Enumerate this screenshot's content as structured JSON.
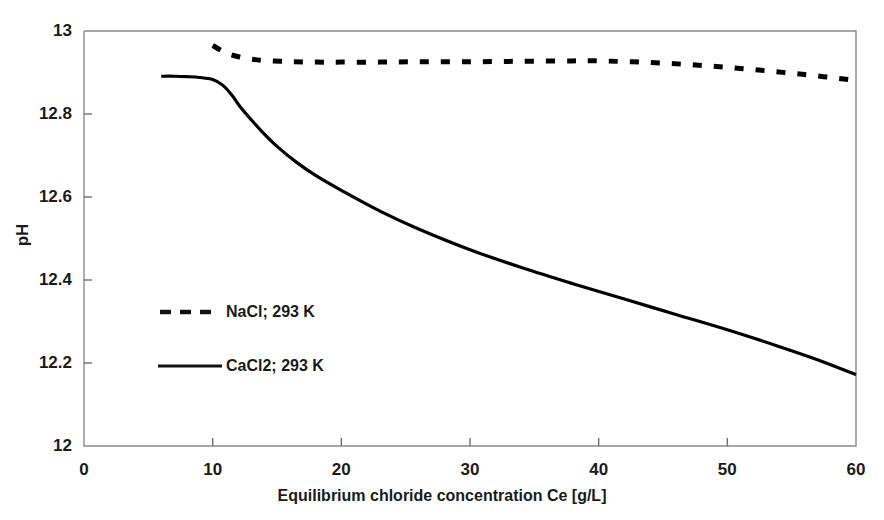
{
  "chart_data": {
    "type": "line",
    "title": "",
    "xlabel": "Equilibrium chloride concentration Ce [g/L]",
    "ylabel": "pH",
    "xlim": [
      0,
      60
    ],
    "ylim": [
      12,
      13
    ],
    "xticks": [
      "0",
      "10",
      "20",
      "30",
      "40",
      "50",
      "60"
    ],
    "xtick_values": [
      0,
      10,
      20,
      30,
      40,
      50,
      60
    ],
    "yticks": [
      "12",
      "12.2",
      "12.4",
      "12.6",
      "12.8",
      "13"
    ],
    "ytick_values": [
      12,
      12.2,
      12.4,
      12.6,
      12.8,
      13
    ],
    "grid": false,
    "legend_position": "inside-left",
    "series": [
      {
        "name": "NaCl; 293 K",
        "style": "dashed",
        "color": "#000000",
        "x": [
          10,
          11,
          12,
          13,
          14,
          16,
          18,
          20,
          23,
          26,
          30,
          34,
          38,
          40,
          44,
          48,
          52,
          56,
          60
        ],
        "y": [
          12.965,
          12.948,
          12.938,
          12.932,
          12.929,
          12.926,
          12.925,
          12.925,
          12.925,
          12.926,
          12.926,
          12.927,
          12.928,
          12.928,
          12.924,
          12.917,
          12.907,
          12.895,
          12.881
        ]
      },
      {
        "name": "CaCl2; 293 K",
        "style": "solid",
        "color": "#000000",
        "x": [
          6,
          7,
          8,
          9,
          10,
          10.8,
          11.5,
          12.2,
          13,
          14,
          15,
          16.5,
          18,
          20,
          23,
          26,
          30,
          34,
          38,
          42,
          46,
          50,
          54,
          57,
          60
        ],
        "y": [
          12.891,
          12.891,
          12.89,
          12.888,
          12.883,
          12.869,
          12.845,
          12.815,
          12.786,
          12.752,
          12.722,
          12.684,
          12.652,
          12.616,
          12.566,
          12.523,
          12.473,
          12.43,
          12.391,
          12.354,
          12.317,
          12.28,
          12.24,
          12.208,
          12.172
        ]
      }
    ]
  },
  "legend": {
    "items": [
      {
        "label": "NaCl; 293 K",
        "style": "dashed"
      },
      {
        "label": "CaCl2; 293 K",
        "style": "solid"
      }
    ]
  }
}
